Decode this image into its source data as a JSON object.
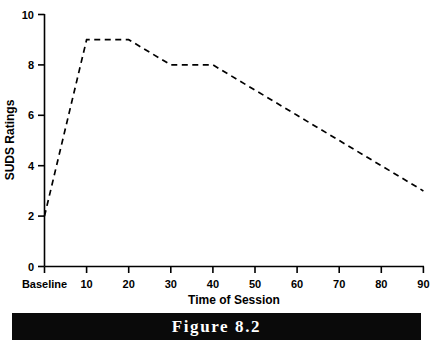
{
  "figure": {
    "caption": "Figure 8.2"
  },
  "chart_data": {
    "type": "line",
    "title": "",
    "xlabel": "Time of Session",
    "ylabel": "SUDS Ratings",
    "x_tick_labels": [
      "Baseline",
      "10",
      "20",
      "30",
      "40",
      "50",
      "60",
      "70",
      "80",
      "90"
    ],
    "y_tick_labels": [
      "0",
      "2",
      "4",
      "6",
      "8",
      "10"
    ],
    "y_ticks": [
      0,
      2,
      4,
      6,
      8,
      10
    ],
    "ylim": [
      0,
      10
    ],
    "xlim": [
      0,
      9
    ],
    "grid": false,
    "legend": null,
    "line_style": "dashed",
    "line_color": "#000000",
    "categories": [
      "Baseline",
      "10",
      "20",
      "30",
      "40",
      "50",
      "60",
      "70",
      "80",
      "90"
    ],
    "values": [
      2,
      9,
      9,
      8,
      8,
      7,
      6,
      5,
      4,
      3
    ],
    "series": [
      {
        "name": "SUDS Ratings",
        "x": [
          "Baseline",
          "10",
          "20",
          "30",
          "40",
          "50",
          "60",
          "70",
          "80",
          "90"
        ],
        "values": [
          2,
          9,
          9,
          8,
          8,
          7,
          6,
          5,
          4,
          3
        ]
      }
    ]
  }
}
